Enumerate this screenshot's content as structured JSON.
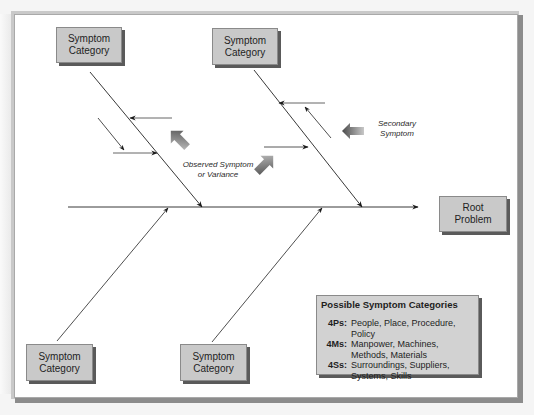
{
  "diagram": {
    "type": "fishbone",
    "colors": {
      "box_fill": "#c9c9c9",
      "box_border": "#8a8a8a",
      "box_shadow": "#5a5a5a",
      "line": "#222222",
      "fat_arrow_dark": "#4a4a4a",
      "fat_arrow_light": "#bdbdbd"
    },
    "category_boxes": [
      {
        "id": "top-left",
        "line1": "Symptom",
        "line2": "Category"
      },
      {
        "id": "top-right",
        "line1": "Symptom",
        "line2": "Category"
      },
      {
        "id": "bottom-left",
        "line1": "Symptom",
        "line2": "Category"
      },
      {
        "id": "bottom-right",
        "line1": "Symptom",
        "line2": "Category"
      }
    ],
    "root_box": {
      "line1": "Root",
      "line2": "Problem"
    },
    "annotations": {
      "observed": {
        "line1": "Observed Symptom",
        "line2": "or Variance"
      },
      "secondary": {
        "line1": "Secondary",
        "line2": "Symptom"
      }
    },
    "legend": {
      "title": "Possible Symptom Categories",
      "rows": [
        {
          "key": "4Ps:",
          "value": "People, Place, Procedure, Policy"
        },
        {
          "key": "4Ms:",
          "value": "Manpower, Machines, Methods, Materials"
        },
        {
          "key": "4Ss:",
          "value": "Surroundings, Suppliers, Systems, Skills"
        }
      ]
    }
  }
}
